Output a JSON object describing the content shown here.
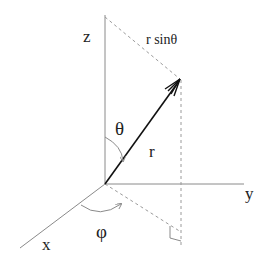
{
  "diagram": {
    "labels": {
      "z_axis": "z",
      "y_axis": "y",
      "x_axis": "x",
      "radius": "r",
      "polar_angle": "θ",
      "azimuth_angle": "φ",
      "projection": "r sinθ"
    },
    "colors": {
      "axis": "#8a8a8a",
      "vector": "#111111",
      "dashed": "#9a9a9a",
      "text": "#222222",
      "background": "#ffffff"
    }
  }
}
